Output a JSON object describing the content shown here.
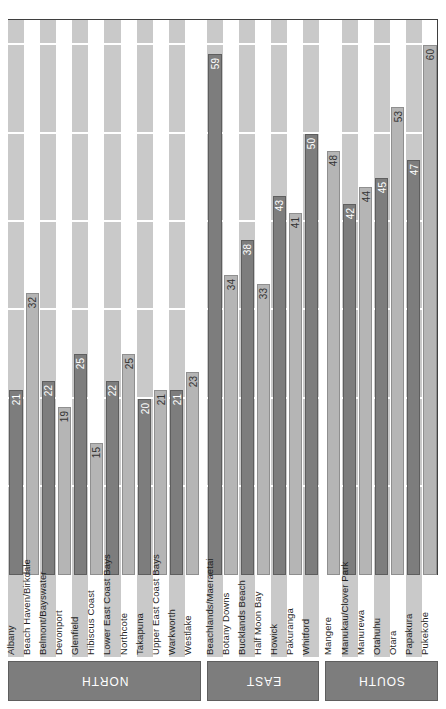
{
  "chart_data": {
    "type": "bar",
    "title": "",
    "subtitle": "",
    "xlabel": "",
    "ylabel": "",
    "orientation": "vertical-rotated",
    "grid": true,
    "legend_position": "none",
    "ylim": [
      0,
      63
    ],
    "gridline_step": 10,
    "gridline_values": [
      0,
      10,
      20,
      30,
      40,
      50,
      60
    ],
    "groups": [
      {
        "name": "NORTH",
        "categories": [
          "Albany",
          "Beach Haven/Birkdale",
          "Belmont/Bayswater",
          "Devonport",
          "Glenfield",
          "Hibiscus Coast",
          "Lower East Coast Bays",
          "Northcote",
          "Takapuna",
          "Upper East Coast Bays",
          "Warkworth",
          "Westlake"
        ],
        "values": [
          21,
          32,
          22,
          19,
          25,
          15,
          22,
          25,
          20,
          21,
          21,
          23
        ]
      },
      {
        "name": "EAST",
        "categories": [
          "Beachlands/Maeraetai",
          "Botany Downs",
          "Bucklands Beach",
          "Half Moon Bay",
          "Howick",
          "Pakuranga",
          "Whitford"
        ],
        "values": [
          59,
          34,
          38,
          33,
          43,
          41,
          50
        ]
      },
      {
        "name": "SOUTH",
        "categories": [
          "Mangere",
          "Manukau/Clover Park",
          "Manurewa",
          "Otahuhu",
          "Otara",
          "Papakura",
          "Pukekohe"
        ],
        "values": [
          48,
          42,
          44,
          45,
          53,
          47,
          60
        ]
      }
    ]
  },
  "colors": {
    "bar_dark": "#7d7d7d",
    "bar_light": "#b5b5b5",
    "band": "#c9c9c9",
    "band_alt": "#ffffff",
    "axis": "#3f3f3f",
    "banner": "#7d7d7d",
    "gridline": "#ffffff"
  }
}
